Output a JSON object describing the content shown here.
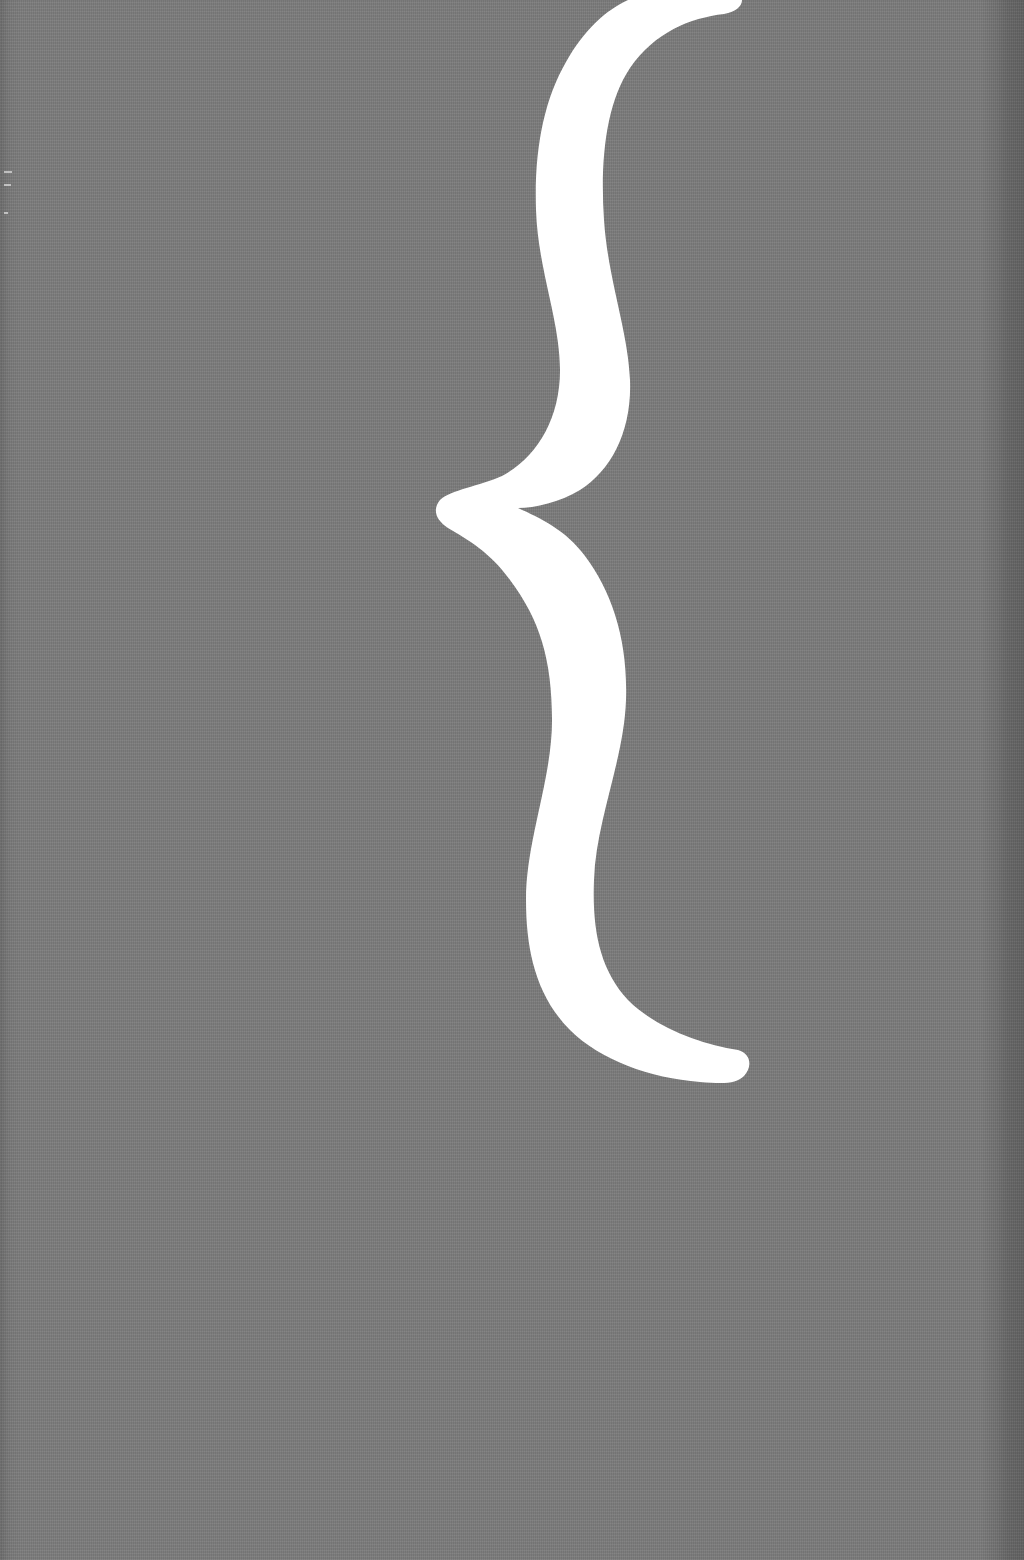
{
  "cover": {
    "background_color": "#7c7c7c",
    "brace_color": "#ffffff",
    "symbol": "{",
    "symbol_name": "left curly brace"
  }
}
